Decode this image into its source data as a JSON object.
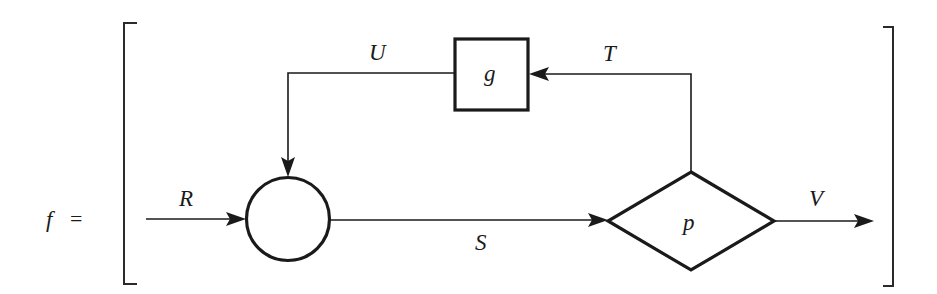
{
  "equation": {
    "lhs": "f",
    "equals": "="
  },
  "nodes": {
    "sum_junction": {
      "shape": "circle",
      "label": ""
    },
    "block_g": {
      "shape": "rectangle",
      "label": "g"
    },
    "decision_p": {
      "shape": "diamond",
      "label": "p"
    }
  },
  "edges": {
    "R": {
      "label": "R",
      "from": "input",
      "to": "sum_junction"
    },
    "S": {
      "label": "S",
      "from": "sum_junction",
      "to": "decision_p"
    },
    "T": {
      "label": "T",
      "from": "decision_p",
      "to": "block_g"
    },
    "U": {
      "label": "U",
      "from": "block_g",
      "to": "sum_junction"
    },
    "V": {
      "label": "V",
      "from": "decision_p",
      "to": "output"
    }
  },
  "colors": {
    "stroke": "#1a1a1a",
    "background": "#ffffff"
  }
}
